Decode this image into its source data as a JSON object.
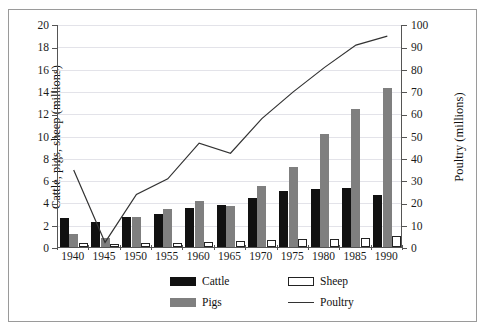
{
  "chart_data": {
    "type": "bar",
    "title": "",
    "subtitle": "",
    "categories": [
      "1940",
      "1945",
      "1950",
      "1955",
      "1960",
      "1965",
      "1970",
      "1975",
      "1980",
      "1985",
      "1990"
    ],
    "xlabel": "",
    "ylabel": "Cattle, pigs, sheep (millions)",
    "y2label": "Poultry (millions)",
    "ylim": [
      0,
      20
    ],
    "y2lim": [
      0,
      100
    ],
    "yticks": [
      0,
      2,
      4,
      6,
      8,
      10,
      12,
      14,
      16,
      18,
      20
    ],
    "y2ticks": [
      0,
      10,
      20,
      30,
      40,
      50,
      60,
      70,
      80,
      90,
      100
    ],
    "grid": true,
    "legend_position": "bottom-center",
    "series": [
      {
        "name": "Cattle",
        "kind": "bar",
        "axis": "left",
        "color": "#111111",
        "values": [
          2.6,
          2.2,
          2.7,
          3.0,
          3.5,
          3.8,
          4.4,
          5.0,
          5.2,
          5.3,
          4.7
        ]
      },
      {
        "name": "Pigs",
        "kind": "bar",
        "axis": "left",
        "color": "#7f7f7f",
        "values": [
          1.2,
          0.8,
          2.7,
          3.4,
          4.1,
          3.7,
          5.5,
          7.2,
          10.1,
          12.4,
          14.3
        ]
      },
      {
        "name": "Sheep",
        "kind": "bar",
        "axis": "left",
        "color": "#ffffff",
        "values": [
          0.35,
          0.3,
          0.4,
          0.4,
          0.45,
          0.5,
          0.6,
          0.7,
          0.75,
          0.8,
          1.0
        ]
      },
      {
        "name": "Poultry",
        "kind": "line",
        "axis": "right",
        "color": "#333333",
        "values": [
          35,
          2.5,
          24,
          31,
          47,
          42.5,
          58,
          70,
          81,
          91,
          95
        ]
      }
    ]
  },
  "legend": {
    "items": [
      {
        "label": "Cattle",
        "swatch": "cattle"
      },
      {
        "label": "Sheep",
        "swatch": "sheep"
      },
      {
        "label": "Pigs",
        "swatch": "pigs"
      },
      {
        "label": "Poultry",
        "swatch": "line"
      }
    ]
  },
  "colors": {
    "cattle": "#111111",
    "pigs": "#7f7f7f",
    "sheep": "#ffffff",
    "poultry": "#333333",
    "grid": "#e3e3e9",
    "axis": "#555555",
    "frame": "#9a9a9a",
    "background": "#ffffff"
  }
}
